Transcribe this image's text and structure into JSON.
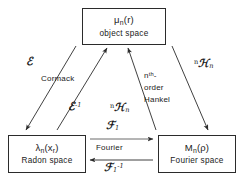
{
  "diagram": {
    "type": "commutative-diagram",
    "nodes": [
      {
        "id": "object",
        "symbol": "μ",
        "symbol_sub": "n",
        "symbol_arg": "(r)",
        "label": "object space"
      },
      {
        "id": "radon",
        "symbol": "λ",
        "symbol_sub": "n",
        "symbol_arg": "(x",
        "symbol_arg_sub": "r",
        "symbol_arg_close": ")",
        "label": "Radon space"
      },
      {
        "id": "fourier",
        "symbol": "M",
        "symbol_sub": "n",
        "symbol_arg": "(ρ)",
        "label": "Fourier space"
      }
    ],
    "edges": {
      "cormack_forward": {
        "operator": "ℰ",
        "name": "Cormack",
        "from": "object",
        "to": "radon"
      },
      "cormack_inverse": {
        "operator": "ℰ",
        "superscript": "-1",
        "from": "radon",
        "to": "object"
      },
      "hankel_left": {
        "operator_pre": "n",
        "operator": "ℋ",
        "operator_sub": "n",
        "from": "fourier",
        "to": "object"
      },
      "hankel_right": {
        "operator_pre": "n",
        "operator": "ℋ",
        "operator_sub": "n",
        "from": "object",
        "to": "fourier"
      },
      "hankel_name": {
        "line1_base": "n",
        "line1_sup": "th",
        "line1_tail": "-",
        "line2": "order",
        "line3": "Hankel"
      },
      "fourier_forward": {
        "operator": "ℱ",
        "operator_sub": "1",
        "name": "Fourier",
        "from": "radon",
        "to": "fourier"
      },
      "fourier_inverse": {
        "operator": "ℱ",
        "operator_sub": "1",
        "superscript": "-1",
        "from": "fourier",
        "to": "radon"
      }
    },
    "colors": {
      "line": "#2b2b2b",
      "text": "#1a1a1a",
      "background": "#ffffff"
    }
  }
}
